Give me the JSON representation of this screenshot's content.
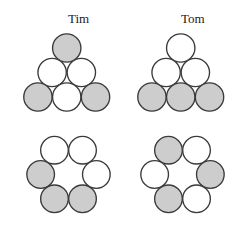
{
  "figure": {
    "width": 240,
    "height": 230,
    "background": "#ffffff",
    "stroke_color": "#3a3a3a",
    "gray_fill": "#cdcdcd",
    "white_fill": "#ffffff"
  },
  "columns": [
    {
      "label": "Tim",
      "label_x": 68,
      "label_y": 12
    },
    {
      "label": "Tom",
      "label_x": 181,
      "label_y": 12
    }
  ],
  "clusters": [
    {
      "name": "tim-triangle",
      "owner": "Tim",
      "arrangement": "triangle",
      "origin_x": 10,
      "origin_y": 26,
      "radius": 16.5,
      "circles": [
        {
          "id": "apex",
          "cx": 48.5,
          "cy": 17.0,
          "fill": "gray"
        },
        {
          "id": "mid-left",
          "cx": 31.5,
          "cy": 45.5,
          "fill": "white"
        },
        {
          "id": "mid-right",
          "cx": 65.5,
          "cy": 45.5,
          "fill": "white"
        },
        {
          "id": "bottom-left",
          "cx": 15.0,
          "cy": 74.0,
          "fill": "gray"
        },
        {
          "id": "bottom-mid",
          "cx": 48.5,
          "cy": 74.0,
          "fill": "white"
        },
        {
          "id": "bottom-right",
          "cx": 82.0,
          "cy": 74.0,
          "fill": "gray"
        }
      ]
    },
    {
      "name": "tom-triangle",
      "owner": "Tom",
      "arrangement": "triangle",
      "origin_x": 124,
      "origin_y": 26,
      "radius": 16.5,
      "circles": [
        {
          "id": "apex",
          "cx": 48.5,
          "cy": 17.0,
          "fill": "white"
        },
        {
          "id": "mid-left",
          "cx": 31.5,
          "cy": 45.5,
          "fill": "white"
        },
        {
          "id": "mid-right",
          "cx": 65.5,
          "cy": 45.5,
          "fill": "white"
        },
        {
          "id": "bottom-left",
          "cx": 15.0,
          "cy": 74.0,
          "fill": "gray"
        },
        {
          "id": "bottom-mid",
          "cx": 48.5,
          "cy": 74.0,
          "fill": "gray"
        },
        {
          "id": "bottom-right",
          "cx": 82.0,
          "cy": 74.0,
          "fill": "gray"
        }
      ]
    },
    {
      "name": "tim-ring",
      "owner": "Tim",
      "arrangement": "hexagonal-ring",
      "origin_x": 26,
      "origin_y": 128,
      "radius": 16.5,
      "circles": [
        {
          "id": "top-left",
          "cx": 16.5,
          "cy": 16.5,
          "fill": "white"
        },
        {
          "id": "top-right",
          "cx": 50.0,
          "cy": 16.5,
          "fill": "white"
        },
        {
          "id": "left",
          "cx": 0.0,
          "cy": 45.5,
          "fill": "gray"
        },
        {
          "id": "right",
          "cx": 66.5,
          "cy": 45.5,
          "fill": "white"
        },
        {
          "id": "bottom-left",
          "cx": 16.5,
          "cy": 74.5,
          "fill": "gray"
        },
        {
          "id": "bottom-right",
          "cx": 50.0,
          "cy": 74.5,
          "fill": "gray"
        }
      ]
    },
    {
      "name": "tom-ring",
      "owner": "Tom",
      "arrangement": "hexagonal-ring",
      "origin_x": 140,
      "origin_y": 128,
      "radius": 16.5,
      "circles": [
        {
          "id": "top-left",
          "cx": 16.5,
          "cy": 16.5,
          "fill": "gray"
        },
        {
          "id": "top-right",
          "cx": 50.0,
          "cy": 16.5,
          "fill": "white"
        },
        {
          "id": "left",
          "cx": 0.0,
          "cy": 45.5,
          "fill": "white"
        },
        {
          "id": "right",
          "cx": 66.5,
          "cy": 45.5,
          "fill": "gray"
        },
        {
          "id": "bottom-left",
          "cx": 16.5,
          "cy": 74.5,
          "fill": "gray"
        },
        {
          "id": "bottom-right",
          "cx": 50.0,
          "cy": 74.5,
          "fill": "white"
        }
      ]
    }
  ]
}
